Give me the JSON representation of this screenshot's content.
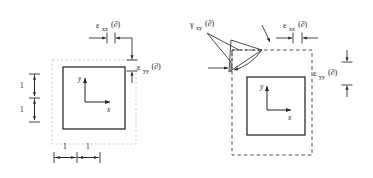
{
  "figure": {
    "background_color": "#ffffff",
    "ink_color": "#232323",
    "faint_color": "#c9c9c9"
  },
  "panels": [
    {
      "id": "left",
      "name": "normal-strain-panel",
      "description": "Unit square with normal strains epsilon-xx and epsilon-yy",
      "element": {
        "reference_outline": "faint-dotted-square",
        "deformed_outline": "solid-square",
        "axes": {
          "origin_label": "",
          "x_label": "x",
          "y_label": "y"
        }
      },
      "labels": [
        {
          "name": "epsilon-xx-label",
          "symbol": "ε",
          "subscript": "xx",
          "argument": "(∂)",
          "full": "εxx(∂)"
        },
        {
          "name": "epsilon-yy-label",
          "symbol": "ε",
          "subscript": "yy",
          "argument": "(∂)",
          "full": "εyy(∂)"
        }
      ],
      "dimensions": [
        {
          "name": "vertical-dim-upper",
          "value": "1",
          "orientation": "vertical"
        },
        {
          "name": "vertical-dim-lower",
          "value": "1",
          "orientation": "vertical"
        },
        {
          "name": "horizontal-dim-left",
          "value": "1",
          "orientation": "horizontal"
        },
        {
          "name": "horizontal-dim-right",
          "value": "1",
          "orientation": "horizontal"
        }
      ]
    },
    {
      "id": "right",
      "name": "shear-strain-panel",
      "description": "Unit square with shear strain gamma-xy plus normal strains",
      "element": {
        "reference_outline": "dashed-square",
        "deformed_outline": "solid-square",
        "axes": {
          "origin_label": "",
          "x_label": "x",
          "y_label": "y"
        }
      },
      "labels": [
        {
          "name": "gamma-xy-label",
          "symbol": "γ",
          "subscript": "xy",
          "argument": "(∂)",
          "full": "γxy(∂)"
        },
        {
          "name": "epsilon-xx-label",
          "symbol": "ε",
          "subscript": "xx",
          "argument": "(∂)",
          "full": "εxx(∂)"
        },
        {
          "name": "epsilon-yy-label",
          "symbol": "ε",
          "subscript": "yy",
          "argument": "(∂)",
          "full": "εyy(∂)"
        }
      ],
      "dimensions": []
    }
  ]
}
